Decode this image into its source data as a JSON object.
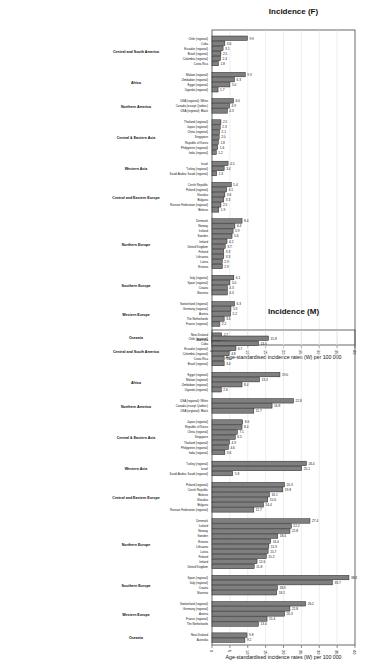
{
  "chart_data": [
    {
      "type": "bar",
      "title": "Incidence (F)",
      "ylabel": "Age-standardised incidence rates (W) per 100 000",
      "ylim": [
        0,
        40
      ],
      "yticks": [
        0,
        5,
        10,
        15,
        20,
        25,
        30,
        35,
        40
      ],
      "grid": true,
      "bar_color": "#7f7f7f",
      "groups": [
        {
          "name": "Central and South America",
          "items": [
            {
              "label": "Chile (regional)",
              "value": 9.9
            },
            {
              "label": "Cuba",
              "value": 3.6
            },
            {
              "label": "Ecuador (regional)",
              "value": 3.1
            },
            {
              "label": "Brazil (regional)",
              "value": 2.5
            },
            {
              "label": "Colombia (regional)",
              "value": 2.4
            },
            {
              "label": "Costa Rica",
              "value": 1.8
            }
          ]
        },
        {
          "name": "Africa",
          "items": [
            {
              "label": "Malawi (regional)",
              "value": 9.3
            },
            {
              "label": "Zimbabwe (regional)",
              "value": 6.3
            },
            {
              "label": "Egypt (regional)",
              "value": 5.0
            },
            {
              "label": "Uganda (regional)",
              "value": 1.7
            }
          ]
        },
        {
          "name": "Northern America",
          "items": [
            {
              "label": "USA (regional): White",
              "value": 6.0
            },
            {
              "label": "Canada (except Quebec)",
              "value": 4.9
            },
            {
              "label": "USA (regional): Black",
              "value": 4.3
            }
          ]
        },
        {
          "name": "Central & Eastern Asia",
          "items": [
            {
              "label": "Thailand (regional)",
              "value": 2.5
            },
            {
              "label": "Japan (regional)",
              "value": 2.3
            },
            {
              "label": "China (regional)",
              "value": 2.1
            },
            {
              "label": "Singapore",
              "value": 2.0
            },
            {
              "label": "Republic of Korea",
              "value": 1.8
            },
            {
              "label": "Philippines (regional)",
              "value": 1.6
            },
            {
              "label": "India (regional)",
              "value": 1.2
            }
          ]
        },
        {
          "name": "Western Asia",
          "items": [
            {
              "label": "Israel",
              "value": 4.5
            },
            {
              "label": "Turkey (regional)",
              "value": 3.4
            },
            {
              "label": "Saudi Arabia: Saudi (regional)",
              "value": 1.3
            }
          ]
        },
        {
          "name": "Central and Eastern Europe",
          "items": [
            {
              "label": "Czech Republic",
              "value": 5.4
            },
            {
              "label": "Poland (regional)",
              "value": 4.1
            },
            {
              "label": "Slovakia",
              "value": 3.6
            },
            {
              "label": "Bulgaria",
              "value": 3.3
            },
            {
              "label": "Russian Federation (regional)",
              "value": 2.5
            },
            {
              "label": "Belarus",
              "value": 1.9
            }
          ]
        },
        {
          "name": "Northern Europe",
          "items": [
            {
              "label": "Denmark",
              "value": 8.4
            },
            {
              "label": "Norway",
              "value": 6.4
            },
            {
              "label": "Iceland",
              "value": 5.9
            },
            {
              "label": "Sweden",
              "value": 5.6
            },
            {
              "label": "Ireland",
              "value": 4.2
            },
            {
              "label": "United Kingdom",
              "value": 3.7
            },
            {
              "label": "Finland",
              "value": 3.3
            },
            {
              "label": "Lithuania",
              "value": 3.3
            },
            {
              "label": "Latvia",
              "value": 2.9
            },
            {
              "label": "Estonia",
              "value": 2.9
            }
          ]
        },
        {
          "name": "Southern Europe",
          "items": [
            {
              "label": "Italy (regional)",
              "value": 6.1
            },
            {
              "label": "Spain (regional)",
              "value": 5.0
            },
            {
              "label": "Croatia",
              "value": 4.3
            },
            {
              "label": "Slovenia",
              "value": 4.3
            }
          ]
        },
        {
          "name": "Western Europe",
          "items": [
            {
              "label": "Switzerland (regional)",
              "value": 6.3
            },
            {
              "label": "Germany (regional)",
              "value": 5.3
            },
            {
              "label": "Austria",
              "value": 5.2
            },
            {
              "label": "The Netherlands",
              "value": 3.4
            },
            {
              "label": "France (regional)",
              "value": 2.2
            }
          ]
        },
        {
          "name": "Oceania",
          "items": [
            {
              "label": "New Zealand",
              "value": 2.7
            },
            {
              "label": "Australia",
              "value": 2.4
            }
          ]
        }
      ]
    },
    {
      "type": "bar",
      "title": "Incidence (M)",
      "ylabel": "Age-standardised incidence rates (W) per 100 000",
      "ylim": [
        0,
        40
      ],
      "yticks": [
        0,
        5,
        10,
        15,
        20,
        25,
        30,
        35,
        40
      ],
      "grid": true,
      "bar_color": "#7f7f7f",
      "groups": [
        {
          "name": "Central and South America",
          "items": [
            {
              "label": "Chile (regional)",
              "value": 15.8
            },
            {
              "label": "Cuba",
              "value": 13.0
            },
            {
              "label": "Ecuador (regional)",
              "value": 6.7
            },
            {
              "label": "Colombia (regional)",
              "value": 4.8
            },
            {
              "label": "Costa Rica",
              "value": 3.4
            },
            {
              "label": "Brazil (regional)",
              "value": 3.4
            }
          ]
        },
        {
          "name": "Africa",
          "items": [
            {
              "label": "Egypt (regional)",
              "value": 19.0
            },
            {
              "label": "Malawi (regional)",
              "value": 13.3
            },
            {
              "label": "Zimbabwe (regional)",
              "value": 8.4
            },
            {
              "label": "Uganda (regional)",
              "value": 2.6
            }
          ]
        },
        {
          "name": "Northern America",
          "items": [
            {
              "label": "USA (regional): White",
              "value": 22.8
            },
            {
              "label": "Canada (except Quebec)",
              "value": 16.8
            },
            {
              "label": "USA (regional): Black",
              "value": 11.7
            }
          ]
        },
        {
          "name": "Central & Eastern Asia",
          "items": [
            {
              "label": "Japan (regional)",
              "value": 8.6
            },
            {
              "label": "Republic of Korea",
              "value": 8.4
            },
            {
              "label": "China (regional)",
              "value": 7.1
            },
            {
              "label": "Singapore",
              "value": 6.5
            },
            {
              "label": "Thailand (regional)",
              "value": 4.9
            },
            {
              "label": "Philippines (regional)",
              "value": 4.6
            },
            {
              "label": "India (regional)",
              "value": 3.6
            }
          ]
        },
        {
          "name": "Western Asia",
          "items": [
            {
              "label": "Turkey (regional)",
              "value": 26.4
            },
            {
              "label": "Israel",
              "value": 25.1
            },
            {
              "label": "Saudi Arabia: Saudi (regional)",
              "value": 5.8
            }
          ]
        },
        {
          "name": "Central and Eastern Europe",
          "items": [
            {
              "label": "Poland (regional)",
              "value": 20.3
            },
            {
              "label": "Czech Republic",
              "value": 19.8
            },
            {
              "label": "Belarus",
              "value": 16.1
            },
            {
              "label": "Slovakia",
              "value": 15.6
            },
            {
              "label": "Bulgaria",
              "value": 14.4
            },
            {
              "label": "Russian Federation (regional)",
              "value": 11.7
            }
          ]
        },
        {
          "name": "Northern Europe",
          "items": [
            {
              "label": "Denmark",
              "value": 27.4
            },
            {
              "label": "Iceland",
              "value": 22.2
            },
            {
              "label": "Norway",
              "value": 21.8
            },
            {
              "label": "Sweden",
              "value": 18.4
            },
            {
              "label": "Estonia",
              "value": 16.4
            },
            {
              "label": "Lithuania",
              "value": 15.9
            },
            {
              "label": "Latvia",
              "value": 15.7
            },
            {
              "label": "Finland",
              "value": 15.2
            },
            {
              "label": "Ireland",
              "value": 12.6
            },
            {
              "label": "United Kingdom",
              "value": 11.8
            }
          ]
        },
        {
          "name": "Southern Europe",
          "items": [
            {
              "label": "Spain (regional)",
              "value": 38.3
            },
            {
              "label": "Italy (regional)",
              "value": 33.7
            },
            {
              "label": "Croatia",
              "value": 18.3
            },
            {
              "label": "Slovenia",
              "value": 18.1
            }
          ]
        },
        {
          "name": "Western Europe",
          "items": [
            {
              "label": "Switzerland (regional)",
              "value": 26.2
            },
            {
              "label": "Germany (regional)",
              "value": 21.8
            },
            {
              "label": "Austria",
              "value": 20.3
            },
            {
              "label": "France (regional)",
              "value": 15.4
            },
            {
              "label": "The Netherlands",
              "value": 13.0
            }
          ]
        },
        {
          "name": "Oceania",
          "items": [
            {
              "label": "New Zealand",
              "value": 9.8
            },
            {
              "label": "Australia",
              "value": 9.2
            }
          ]
        }
      ]
    }
  ]
}
